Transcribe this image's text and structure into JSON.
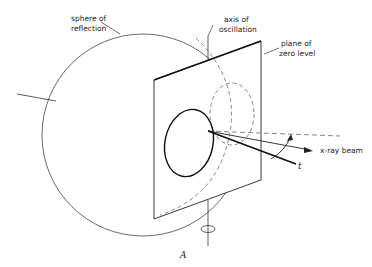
{
  "diagram": {
    "labels": {
      "sphere_line1": "sphere of",
      "sphere_line2": "reflection",
      "axis_line1": "axis of",
      "axis_line2": "oscillation",
      "plane_line1": "plane of",
      "plane_line2": "zero level",
      "beam": "x-ray beam",
      "t": "t",
      "figure": "A"
    },
    "colors": {
      "stroke": "#222222",
      "dashed": "#666666",
      "background": "#ffffff"
    }
  }
}
